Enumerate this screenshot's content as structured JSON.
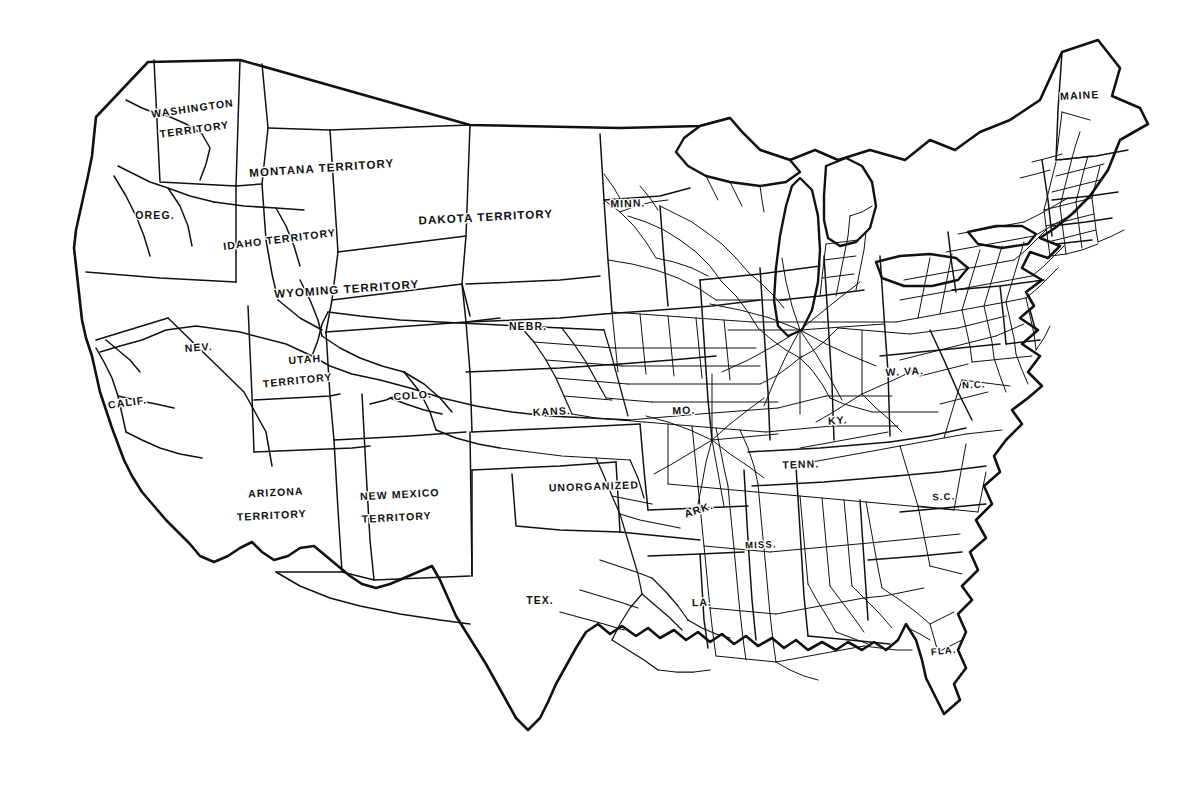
{
  "map": {
    "title": "Railroads of the United States",
    "era_note": "Territorial-era United States",
    "background_color": "#ffffff",
    "ink_color": "#111111",
    "width": 1201,
    "height": 799
  },
  "labels": [
    {
      "id": "washington-territory",
      "text": "WASHINGTON",
      "x": 193,
      "y": 112,
      "rotate": -8,
      "size": "lbl-md"
    },
    {
      "id": "washington-territory-2",
      "text": "TERRITORY",
      "x": 195,
      "y": 133,
      "rotate": -8,
      "size": "lbl-md"
    },
    {
      "id": "oregon",
      "text": "OREG.",
      "x": 155,
      "y": 219,
      "rotate": 0,
      "size": "lbl-md"
    },
    {
      "id": "idaho-territory",
      "text": "IDAHO TERRITORY",
      "x": 280,
      "y": 243,
      "rotate": -7,
      "size": "lbl-md"
    },
    {
      "id": "montana-territory",
      "text": "MONTANA TERRITORY",
      "x": 322,
      "y": 172,
      "rotate": -4,
      "size": "lbl-lg"
    },
    {
      "id": "wyoming-territory",
      "text": "WYOMING TERRITORY",
      "x": 347,
      "y": 293,
      "rotate": -4,
      "size": "lbl-lg"
    },
    {
      "id": "dakota-territory",
      "text": "DAKOTA TERRITORY",
      "x": 486,
      "y": 221,
      "rotate": -3,
      "size": "lbl-lg"
    },
    {
      "id": "minnesota",
      "text": "MINN.",
      "x": 628,
      "y": 207,
      "rotate": -2,
      "size": "lbl-md"
    },
    {
      "id": "nebraska",
      "text": "NEBR.",
      "x": 528,
      "y": 330,
      "rotate": 0,
      "size": "lbl-md"
    },
    {
      "id": "nevada",
      "text": "NEV.",
      "x": 199,
      "y": 351,
      "rotate": -4,
      "size": "lbl-md"
    },
    {
      "id": "utah-territory",
      "text": "UTAH",
      "x": 305,
      "y": 363,
      "rotate": -4,
      "size": "lbl-md"
    },
    {
      "id": "utah-territory-2",
      "text": "TERRITORY",
      "x": 298,
      "y": 384,
      "rotate": -6,
      "size": "lbl-md"
    },
    {
      "id": "colorado",
      "text": "COLO.",
      "x": 413,
      "y": 399,
      "rotate": -4,
      "size": "lbl-md"
    },
    {
      "id": "california",
      "text": "CALIF.",
      "x": 128,
      "y": 406,
      "rotate": -8,
      "size": "lbl-md"
    },
    {
      "id": "kansas",
      "text": "KANS.",
      "x": 552,
      "y": 415,
      "rotate": -3,
      "size": "lbl-md"
    },
    {
      "id": "missouri",
      "text": "MO.",
      "x": 684,
      "y": 414,
      "rotate": -2,
      "size": "lbl-md"
    },
    {
      "id": "kentucky",
      "text": "KY.",
      "x": 838,
      "y": 424,
      "rotate": -4,
      "size": "lbl-md"
    },
    {
      "id": "west-virginia",
      "text": "W. VA.",
      "x": 905,
      "y": 375,
      "rotate": -3,
      "size": "lbl-md"
    },
    {
      "id": "north-carolina",
      "text": "N.C.",
      "x": 974,
      "y": 388,
      "rotate": -3,
      "size": "lbl-sm"
    },
    {
      "id": "tennessee",
      "text": "TENN.",
      "x": 801,
      "y": 468,
      "rotate": -2,
      "size": "lbl-md"
    },
    {
      "id": "south-carolina",
      "text": "S.C.",
      "x": 944,
      "y": 500,
      "rotate": -3,
      "size": "lbl-sm"
    },
    {
      "id": "arizona-territory",
      "text": "ARIZONA",
      "x": 276,
      "y": 496,
      "rotate": -3,
      "size": "lbl-md"
    },
    {
      "id": "arizona-territory-2",
      "text": "TERRITORY",
      "x": 272,
      "y": 519,
      "rotate": -3,
      "size": "lbl-md"
    },
    {
      "id": "new-mexico-territory",
      "text": "NEW MEXICO",
      "x": 400,
      "y": 498,
      "rotate": -3,
      "size": "lbl-md"
    },
    {
      "id": "new-mexico-territory-2",
      "text": "TERRITORY",
      "x": 397,
      "y": 521,
      "rotate": -3,
      "size": "lbl-md"
    },
    {
      "id": "unorganized",
      "text": "UNORGANIZED",
      "x": 594,
      "y": 490,
      "rotate": -2,
      "size": "lbl-md"
    },
    {
      "id": "arkansas",
      "text": "ARK.",
      "x": 700,
      "y": 513,
      "rotate": -18,
      "size": "lbl-md"
    },
    {
      "id": "mississippi",
      "text": "MISS.",
      "x": 761,
      "y": 548,
      "rotate": -2,
      "size": "lbl-sm"
    },
    {
      "id": "louisiana",
      "text": "LA.",
      "x": 702,
      "y": 606,
      "rotate": -2,
      "size": "lbl-md"
    },
    {
      "id": "texas",
      "text": "TEX.",
      "x": 540,
      "y": 604,
      "rotate": 0,
      "size": "lbl-md"
    },
    {
      "id": "florida",
      "text": "FLA.",
      "x": 944,
      "y": 654,
      "rotate": -6,
      "size": "lbl-sm"
    },
    {
      "id": "maine",
      "text": "MAINE",
      "x": 1080,
      "y": 99,
      "rotate": -3,
      "size": "lbl-md"
    }
  ],
  "legend_note": "Dense rail network east of the Missouri River; sparse transcontinental trunk lines across the western territories."
}
